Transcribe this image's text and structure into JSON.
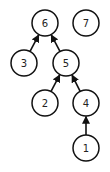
{
  "diagram": {
    "type": "directed-forest",
    "nodes": [
      {
        "id": "6",
        "label": "6",
        "x": 45,
        "y": 23
      },
      {
        "id": "7",
        "label": "7",
        "x": 86,
        "y": 23
      },
      {
        "id": "3",
        "label": "3",
        "x": 24,
        "y": 63
      },
      {
        "id": "5",
        "label": "5",
        "x": 66,
        "y": 63
      },
      {
        "id": "2",
        "label": "2",
        "x": 45,
        "y": 103
      },
      {
        "id": "4",
        "label": "4",
        "x": 86,
        "y": 103
      },
      {
        "id": "1",
        "label": "1",
        "x": 86,
        "y": 148
      }
    ],
    "edges": [
      {
        "from": "3",
        "to": "6"
      },
      {
        "from": "5",
        "to": "6"
      },
      {
        "from": "2",
        "to": "5"
      },
      {
        "from": "4",
        "to": "5"
      },
      {
        "from": "1",
        "to": "4"
      }
    ]
  }
}
